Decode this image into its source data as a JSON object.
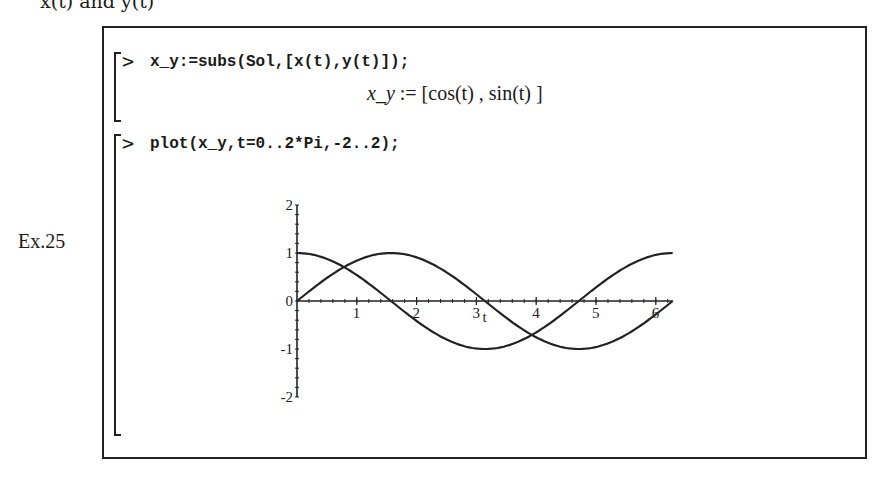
{
  "page": {
    "top_cut_text": "x(t) and y(t)",
    "example_label": "Ex.25"
  },
  "worksheet": {
    "groups": [
      {
        "prompt": ">",
        "input": "x_y:=subs(Sol,[x(t),y(t)]);",
        "output": {
          "lhs": "x_y",
          "assign": ":=",
          "rhs": "[cos(t) , sin(t) ]"
        }
      },
      {
        "prompt": ">",
        "input": "plot(x_y,t=0..2*Pi,-2..2);"
      }
    ]
  },
  "chart_data": {
    "type": "line",
    "title": "",
    "xlabel": "t",
    "ylabel": "",
    "xlim": [
      0,
      6.2832
    ],
    "ylim": [
      -2,
      2
    ],
    "x_ticks": [
      "1",
      "2",
      "3",
      "4",
      "5",
      "6"
    ],
    "y_ticks": [
      "2",
      "1",
      "0",
      "-1",
      "-2"
    ],
    "grid": false,
    "series": [
      {
        "name": "cos(t)",
        "function": "cos",
        "samples": [
          [
            0,
            1
          ],
          [
            0.785,
            0.707
          ],
          [
            1.571,
            0
          ],
          [
            2.356,
            -0.707
          ],
          [
            3.142,
            -1
          ],
          [
            3.927,
            -0.707
          ],
          [
            4.712,
            0
          ],
          [
            5.498,
            0.707
          ],
          [
            6.283,
            1
          ]
        ]
      },
      {
        "name": "sin(t)",
        "function": "sin",
        "samples": [
          [
            0,
            0
          ],
          [
            0.785,
            0.707
          ],
          [
            1.571,
            1
          ],
          [
            2.356,
            0.707
          ],
          [
            3.142,
            0
          ],
          [
            3.927,
            -0.707
          ],
          [
            4.712,
            -1
          ],
          [
            5.498,
            -0.707
          ],
          [
            6.283,
            0
          ]
        ]
      }
    ]
  }
}
